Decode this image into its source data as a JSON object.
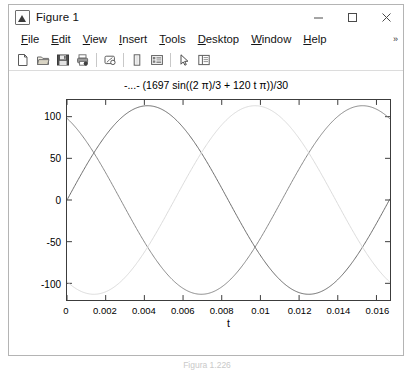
{
  "window": {
    "title": "Figure 1",
    "app_icon": "matlab-figure-icon",
    "controls": {
      "minimize_label": "Minimize",
      "maximize_label": "Maximize",
      "close_label": "Close"
    }
  },
  "menu": {
    "items": [
      {
        "pre": "",
        "mnemonic": "F",
        "post": "ile",
        "name": "file"
      },
      {
        "pre": "",
        "mnemonic": "E",
        "post": "dit",
        "name": "edit"
      },
      {
        "pre": "",
        "mnemonic": "V",
        "post": "iew",
        "name": "view"
      },
      {
        "pre": "",
        "mnemonic": "I",
        "post": "nsert",
        "name": "insert"
      },
      {
        "pre": "",
        "mnemonic": "T",
        "post": "ools",
        "name": "tools"
      },
      {
        "pre": "",
        "mnemonic": "D",
        "post": "esktop",
        "name": "desktop"
      },
      {
        "pre": "",
        "mnemonic": "W",
        "post": "indow",
        "name": "window"
      },
      {
        "pre": "",
        "mnemonic": "H",
        "post": "elp",
        "name": "help"
      }
    ],
    "overflow_glyph": "»"
  },
  "toolbar": {
    "buttons": [
      {
        "name": "new-figure-icon",
        "label": "New Figure"
      },
      {
        "name": "open-file-icon",
        "label": "Open File"
      },
      {
        "name": "save-figure-icon",
        "label": "Save Figure"
      },
      {
        "name": "print-figure-icon",
        "label": "Print Figure"
      },
      {
        "name": "link-plot-icon",
        "label": "Link Plot"
      },
      {
        "name": "insert-colorbar-icon",
        "label": "Insert Colorbar"
      },
      {
        "name": "insert-legend-icon",
        "label": "Insert Legend"
      },
      {
        "name": "edit-plot-icon",
        "label": "Edit Plot"
      },
      {
        "name": "show-plot-tools-icon",
        "label": "Show Plot Tools and Dock Figure"
      }
    ]
  },
  "caption": "Figura 1.226",
  "chart_data": {
    "type": "line",
    "title": "-...- (1697 sin((2 π)/3 + 120 t π))/30",
    "xlabel": "t",
    "ylabel": "",
    "xlim": [
      0,
      0.0167
    ],
    "ylim": [
      -120,
      120
    ],
    "xticks": [
      0,
      0.002,
      0.004,
      0.006,
      0.008,
      0.01,
      0.012,
      0.014,
      0.016
    ],
    "xticklabels": [
      "0",
      "0.002",
      "0.004",
      "0.006",
      "0.008",
      "0.01",
      "0.012",
      "0.014",
      "0.016"
    ],
    "yticks": [
      -100,
      -50,
      0,
      50,
      100
    ],
    "yticklabels": [
      "-100",
      "-50",
      "0",
      "50",
      "100"
    ],
    "grid": false,
    "legend": "none",
    "amplitude": 113.13,
    "frequency_hz": 60,
    "series": [
      {
        "name": "phase-a",
        "color": "#7a7a7a",
        "phase_deg": 120,
        "expression": "113.13 sin(120 pi t + 2 pi/3)",
        "start_value": 97.95,
        "width": 0.9
      },
      {
        "name": "phase-b",
        "color": "#5c5c5c",
        "phase_deg": 0,
        "expression": "113.13 sin(120 pi t)",
        "start_value": 0,
        "width": 0.9
      },
      {
        "name": "phase-c",
        "color": "#d6d6d6",
        "phase_deg": -120,
        "expression": "113.13 sin(120 pi t - 2 pi/3)",
        "start_value": -97.95,
        "width": 0.9
      }
    ]
  }
}
